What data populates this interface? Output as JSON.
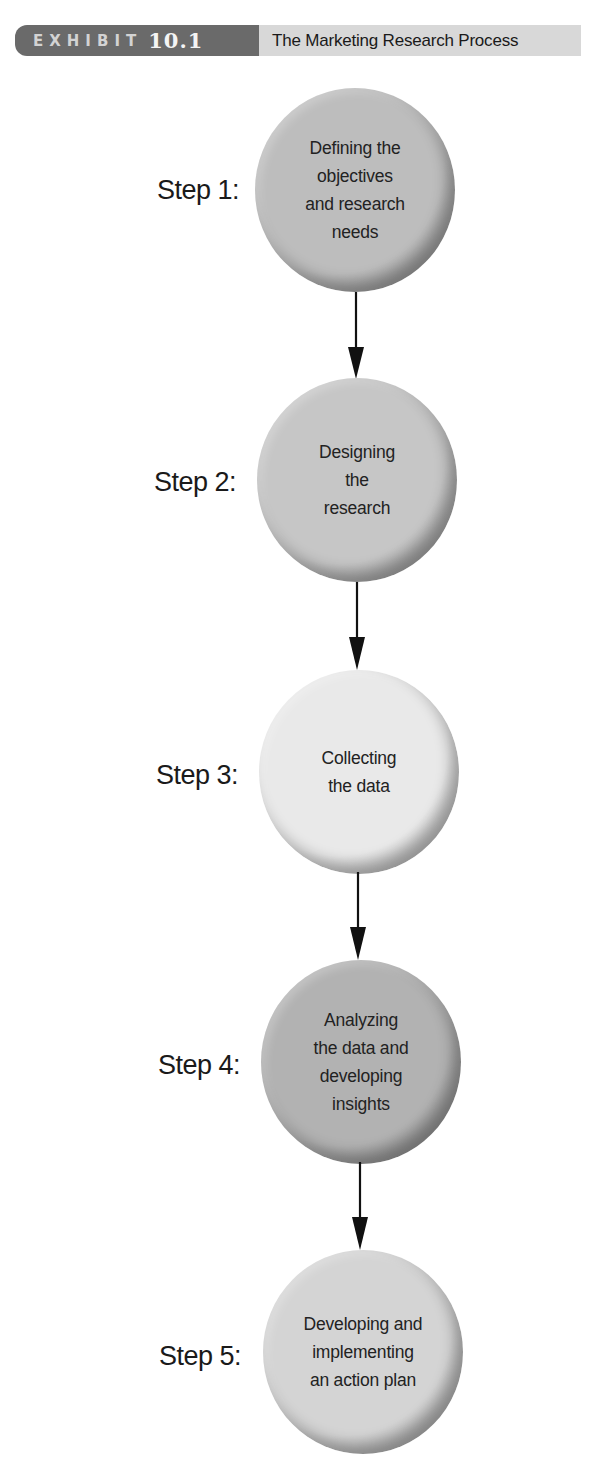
{
  "header": {
    "exhibit_word": "EXHIBIT",
    "exhibit_number": "10.1",
    "title": "The Marketing Research Process",
    "tab_color": "#6a6a6a",
    "title_bg_color": "#d8d8d8"
  },
  "steps": [
    {
      "label": "Step 1:",
      "text": "Defining the\nobjectives\nand research\nneeds",
      "color": "#bdbdbd"
    },
    {
      "label": "Step 2:",
      "text": "Designing\nthe\nresearch",
      "color": "#c6c6c6"
    },
    {
      "label": "Step 3:",
      "text": "Collecting\nthe data",
      "color": "#e9e9e9"
    },
    {
      "label": "Step 4:",
      "text": "Analyzing\nthe data and\ndeveloping\ninsights",
      "color": "#b2b2b2"
    },
    {
      "label": "Step 5:",
      "text": "Developing and\nimplementing\nan action plan",
      "color": "#d4d4d4"
    }
  ],
  "arrow_color": "#111111"
}
